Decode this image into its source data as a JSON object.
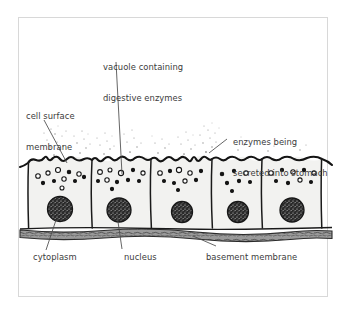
{
  "figure": {
    "background": "#ffffff",
    "frame_color": "#d8d8d8",
    "ink_color": "#1a1a1a",
    "text_color": "#3b3b3b",
    "cell_fill": "#f2f2f0",
    "nucleus_fill": "#2a2a2a",
    "basement_fill": "#8c8c8c"
  },
  "labels": {
    "vacuole": {
      "line1": "vacuole containing",
      "line2": "digestive enzymes"
    },
    "cell_surface": {
      "line1": "cell surface",
      "line2": "membrane"
    },
    "enzymes": {
      "line1": "enzymes being",
      "line2": "secreted into stomach"
    },
    "cytoplasm": {
      "line1": "cytoplasm"
    },
    "nucleus": {
      "line1": "nucleus"
    },
    "basement": {
      "line1": "basement membrane"
    }
  },
  "diagram_data": {
    "type": "biological-diagram",
    "subject": "columnar epithelial cells of the stomach lining",
    "cell_count": 5,
    "cells": [
      {
        "index": 1,
        "x_left": 28,
        "x_right": 92,
        "nucleus_cx": 60,
        "nucleus_cy": 209,
        "nucleus_r": 12.5,
        "vesicles": 11
      },
      {
        "index": 2,
        "x_left": 92,
        "x_right": 151,
        "nucleus_cx": 119,
        "nucleus_cy": 210,
        "nucleus_r": 12.0,
        "vesicles": 11
      },
      {
        "index": 3,
        "x_left": 151,
        "x_right": 212,
        "nucleus_cx": 182,
        "nucleus_cy": 212,
        "nucleus_r": 10.5,
        "vesicles": 10
      },
      {
        "index": 4,
        "x_left": 212,
        "x_right": 262,
        "nucleus_cx": 238,
        "nucleus_cy": 212,
        "nucleus_r": 10.5,
        "vesicles": 7
      },
      {
        "index": 5,
        "x_left": 262,
        "x_right": 322,
        "nucleus_cx": 292,
        "nucleus_cy": 210,
        "nucleus_r": 12.0,
        "vesicles": 9
      }
    ],
    "apical_surface_y": 160,
    "basal_surface_y": 228,
    "basement_membrane_y": 232,
    "enzyme_plume_region": {
      "y_top": 118,
      "y_bottom": 160
    },
    "annotations": [
      "cell surface membrane",
      "vacuole containing digestive enzymes",
      "enzymes being secreted into stomach",
      "cytoplasm",
      "nucleus",
      "basement membrane"
    ]
  }
}
